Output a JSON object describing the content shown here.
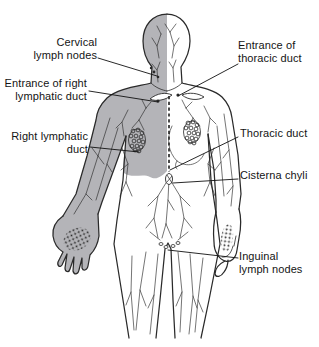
{
  "labels": [
    {
      "id": "cervical-lymph-nodes",
      "text": "Cervical\nlymph nodes"
    },
    {
      "id": "entrance-of-right-lymphatic-duct",
      "text": "Entrance of right\nlymphatic duct"
    },
    {
      "id": "right-lymphatic-duct",
      "text": "Right lymphatic\nduct"
    },
    {
      "id": "entrance-of-thoracic-duct",
      "text": "Entrance of\nthoracic duct"
    },
    {
      "id": "thoracic-duct",
      "text": "Thoracic duct"
    },
    {
      "id": "cisterna-chyli",
      "text": "Cisterna chyli"
    },
    {
      "id": "inguinal-lymph-nodes",
      "text": "Inguinal\nlymph nodes"
    }
  ],
  "colors": {
    "background": "#ffffff",
    "line": "#2a2a2a",
    "shading": "#b4b4b8",
    "text": "#141414"
  }
}
